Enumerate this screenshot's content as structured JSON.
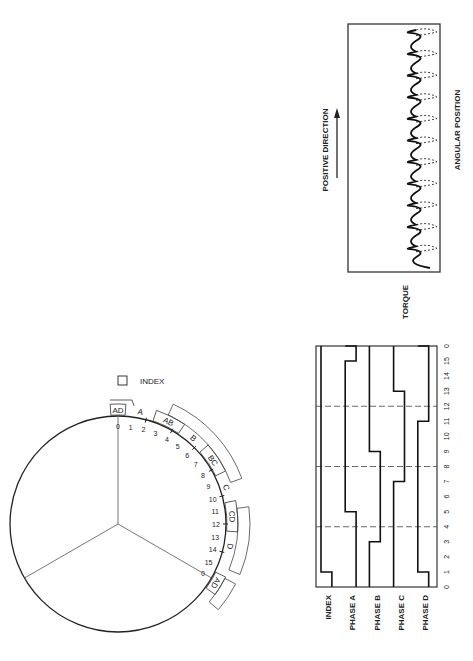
{
  "torque_chart": {
    "ylabel": "TORQUE",
    "xlabel": "ANGULAR POSITION",
    "arrow_label": "POSITIVE DIRECTION",
    "cycles": 11
  },
  "timing_chart": {
    "axis_ticks": [
      "0",
      "1",
      "2",
      "3",
      "4",
      "5",
      "6",
      "7",
      "8",
      "9",
      "10",
      "11",
      "12",
      "13",
      "14",
      "15",
      "0"
    ],
    "dashed_gridlines_at": [
      4,
      8,
      12
    ],
    "signals": [
      {
        "name": "INDEX",
        "high_ranges": [
          [
            0,
            1
          ]
        ]
      },
      {
        "name": "PHASE A",
        "high_ranges": [
          [
            0,
            5
          ],
          [
            15,
            16
          ]
        ]
      },
      {
        "name": "PHASE B",
        "high_ranges": [
          [
            3,
            9
          ]
        ]
      },
      {
        "name": "PHASE C",
        "high_ranges": [
          [
            7,
            13
          ]
        ]
      },
      {
        "name": "PHASE D",
        "high_ranges": [
          [
            0,
            1
          ],
          [
            11,
            16
          ]
        ]
      }
    ]
  },
  "rotor_diagram": {
    "index_legend": "INDEX",
    "position_labels": [
      "0",
      "1",
      "2",
      "3",
      "4",
      "5",
      "6",
      "7",
      "8",
      "9",
      "10",
      "11",
      "12",
      "13",
      "14",
      "15",
      "0"
    ],
    "phase_sectors": [
      "AD",
      "A",
      "AB",
      "B",
      "BC",
      "C",
      "CD",
      "D",
      "AD"
    ]
  }
}
